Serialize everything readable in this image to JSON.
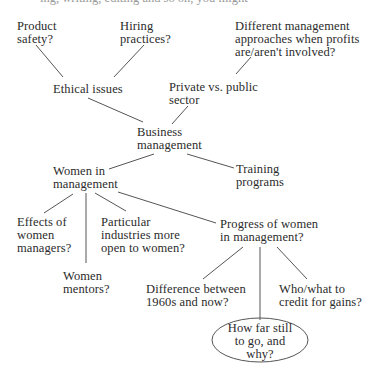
{
  "diagram": {
    "type": "cluster-map",
    "top_clipped_text": "ing, writing, editing and so on, you might",
    "nodes": {
      "product_safety": "Product\nsafety?",
      "hiring_practices": "Hiring\npractices?",
      "different_mgmt": "Different management\napproaches when profits\nare/aren't involved?",
      "ethical_issues": "Ethical issues",
      "private_public": "Private vs. public\nsector",
      "business_management": "Business\nmanagement",
      "women_in_management": "Women in\nmanagement",
      "training_programs": "Training\nprograms",
      "effects_women_managers": "Effects of\nwomen\nmanagers?",
      "particular_industries": "Particular\nindustries more\nopen to women?",
      "progress_women": "Progress of women\nin management?",
      "women_mentors": "Women\nmentors?",
      "difference_1960s": "Difference between\n1960s and now?",
      "who_what_credit": "Who/what to\ncredit for gains?",
      "how_far": "How far still\nto go, and\nwhy?"
    },
    "edges": [
      [
        "product_safety",
        "ethical_issues"
      ],
      [
        "hiring_practices",
        "ethical_issues"
      ],
      [
        "different_mgmt",
        "private_public"
      ],
      [
        "ethical_issues",
        "business_management"
      ],
      [
        "private_public",
        "business_management"
      ],
      [
        "business_management",
        "women_in_management"
      ],
      [
        "business_management",
        "training_programs"
      ],
      [
        "women_in_management",
        "effects_women_managers"
      ],
      [
        "women_in_management",
        "women_mentors"
      ],
      [
        "women_in_management",
        "particular_industries"
      ],
      [
        "women_in_management",
        "progress_women"
      ],
      [
        "progress_women",
        "difference_1960s"
      ],
      [
        "progress_women",
        "how_far"
      ],
      [
        "progress_women",
        "who_what_credit"
      ]
    ],
    "highlighted_node": "how_far",
    "line_color": "#555555"
  }
}
